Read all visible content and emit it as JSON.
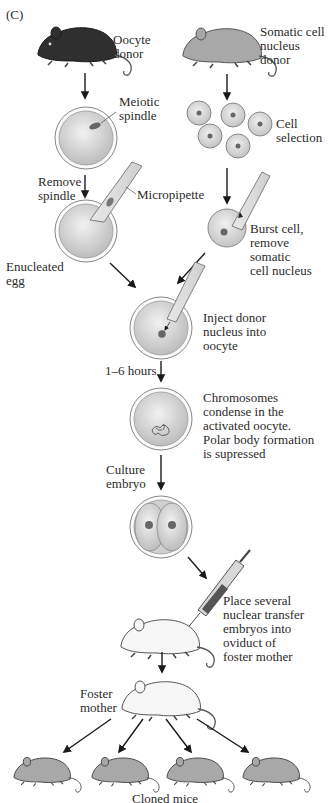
{
  "panel_label": "(C)",
  "labels": {
    "oocyte_donor": "Oocyte\ndonor",
    "somatic_donor": "Somatic cell\nnucleus\ndonor",
    "meiotic_spindle": "Meiotic\nspindle",
    "cell_selection": "Cell\nselection",
    "remove_spindle": "Remove\nspindle",
    "micropipette": "Micropipette",
    "burst_cell": "Burst cell,\nremove somatic\ncell nucleus",
    "enucleated_egg": "Enucleated\negg",
    "inject_donor": "Inject donor\nnucleus into\noocyte",
    "hours": "1–6 hours",
    "chromosomes": "Chromosomes\ncondense in the\nactivated oocyte.\nPolar body formation\nis supressed",
    "culture_embryo": "Culture\nembryo",
    "place_embryos": "Place several\nnuclear transfer\nembryos into\noviduct of\nfoster mother",
    "foster_mother": "Foster\nmother",
    "cloned_mice": "Cloned mice"
  },
  "colors": {
    "dark_mouse": "#2f2f2f",
    "gray_mouse": "#a8a8a8",
    "white_mouse": "#f4f4f4",
    "cell_fill": "#d6d6d6",
    "nucleus": "#6a6a6a",
    "arrow": "#1a1a1a"
  }
}
